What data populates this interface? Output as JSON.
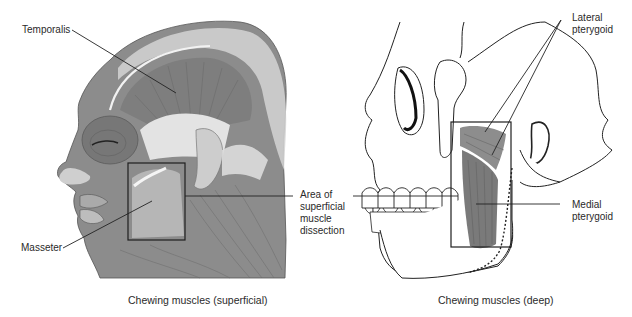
{
  "figure": {
    "panels": [
      {
        "id": "superficial",
        "caption": "Chewing muscles (superficial)",
        "labels": [
          {
            "text": "Temporalis"
          },
          {
            "text": "Masseter"
          }
        ]
      },
      {
        "id": "deep",
        "caption": "Chewing muscles (deep)",
        "labels": [
          {
            "text": "Lateral pterygoid",
            "lines": [
              "Lateral",
              "pterygoid"
            ]
          },
          {
            "text": "Medial pterygoid",
            "lines": [
              "Medial",
              "pterygoid"
            ]
          }
        ]
      }
    ],
    "center_label": {
      "text": "Area of superficial muscle dissection",
      "lines": [
        "Area of",
        "superficial",
        "muscle",
        "dissection"
      ]
    }
  },
  "colors": {
    "muscle": "#8a8a8a",
    "muscle_dark": "#6e6e6e",
    "tendon": "#d6d6d6",
    "skin_light": "#c8c8c8",
    "leader": "#222222",
    "background": "#ffffff"
  }
}
